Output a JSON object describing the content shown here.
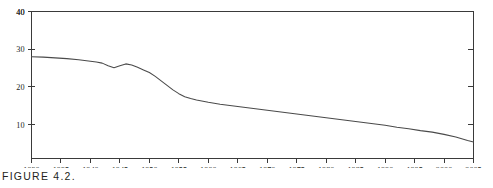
{
  "figure": {
    "caption": "FIGURE 4.2."
  },
  "chart_data": {
    "type": "line",
    "title": "",
    "xlabel": "",
    "ylabel": "",
    "xlim": [
      1930,
      2005
    ],
    "ylim": [
      1,
      40
    ],
    "grid": false,
    "legend": null,
    "xticks": [
      1930,
      1935,
      1940,
      1945,
      1950,
      1955,
      1960,
      1965,
      1970,
      1975,
      1980,
      1985,
      1990,
      1995,
      2000,
      2005
    ],
    "xtick_labels": [
      "1930",
      "1935",
      "1940",
      "1945",
      "1950",
      "1955",
      "1960",
      "1965",
      "1970",
      "1975",
      "1980",
      "1985",
      "1990",
      "1995",
      "2000",
      "2005"
    ],
    "yticks": [
      10,
      20,
      30,
      40
    ],
    "ytick_labels": [
      "10",
      "20",
      "30",
      "40"
    ],
    "series": [
      {
        "name": "rate",
        "x": [
          1930,
          1932,
          1934,
          1936,
          1938,
          1940,
          1941,
          1942,
          1943,
          1944,
          1945,
          1946,
          1947,
          1948,
          1949,
          1950,
          1951,
          1952,
          1953,
          1954,
          1955,
          1956,
          1957,
          1958,
          1960,
          1962,
          1964,
          1966,
          1968,
          1970,
          1972,
          1974,
          1976,
          1978,
          1980,
          1982,
          1984,
          1986,
          1988,
          1990,
          1992,
          1994,
          1996,
          1998,
          2000,
          2002,
          2004,
          2005
        ],
        "values": [
          28.0,
          27.9,
          27.7,
          27.5,
          27.2,
          26.8,
          26.6,
          26.3,
          25.6,
          25.1,
          25.6,
          26.1,
          25.8,
          25.2,
          24.5,
          23.8,
          22.8,
          21.6,
          20.4,
          19.2,
          18.2,
          17.4,
          16.9,
          16.5,
          15.9,
          15.4,
          15.0,
          14.6,
          14.2,
          13.8,
          13.4,
          13.0,
          12.6,
          12.2,
          11.8,
          11.4,
          11.0,
          10.6,
          10.2,
          9.8,
          9.3,
          8.9,
          8.4,
          8.0,
          7.4,
          6.7,
          5.8,
          5.4
        ]
      }
    ]
  }
}
